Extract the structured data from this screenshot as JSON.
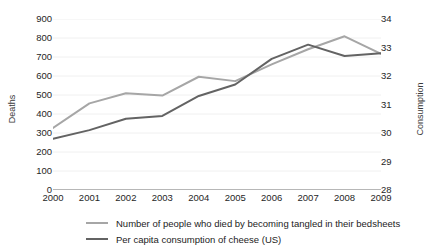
{
  "chart_data": {
    "type": "line",
    "title": "",
    "xlabel": "",
    "categories": [
      "2000",
      "2001",
      "2002",
      "2003",
      "2004",
      "2005",
      "2006",
      "2007",
      "2008",
      "2009"
    ],
    "grid": true,
    "legend_position": "bottom",
    "left_axis": {
      "label": "Deaths",
      "ticks": [
        "0",
        "100",
        "200",
        "300",
        "400",
        "500",
        "600",
        "700",
        "800",
        "900"
      ],
      "min": 0,
      "max": 900
    },
    "right_axis": {
      "label": "Consumption",
      "ticks": [
        "28",
        "29",
        "30",
        "31",
        "32",
        "33",
        "34"
      ],
      "min": 28,
      "max": 34
    },
    "series": [
      {
        "name": "Number of people who died by becoming tangled in their bedsheets",
        "axis": "left",
        "color": "#a6a6a6",
        "values": [
          327,
          456,
          509,
          497,
          596,
          573,
          661,
          741,
          809,
          717
        ]
      },
      {
        "name": "Per capita consumption of cheese (US)",
        "axis": "right",
        "color": "#636363",
        "values": [
          29.8,
          30.1,
          30.5,
          30.6,
          31.3,
          31.7,
          32.6,
          33.1,
          32.7,
          32.8
        ]
      }
    ]
  },
  "legend": {
    "items": [
      {
        "label": "Number of people who died by becoming tangled in their bedsheets",
        "color": "#a6a6a6"
      },
      {
        "label": "Per capita consumption of cheese (US)",
        "color": "#636363"
      }
    ]
  }
}
